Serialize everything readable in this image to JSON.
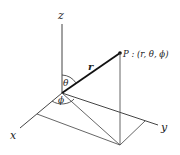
{
  "diagram": {
    "type": "spherical-coordinates",
    "labels": {
      "z_axis": "z",
      "x_axis": "x",
      "y_axis": "y",
      "radius": "r",
      "theta": "θ",
      "phi": "ϕ",
      "point": "P : (r, θ, ϕ)"
    },
    "colors": {
      "line": "#333333",
      "radius_line": "#111111",
      "background": "#ffffff"
    }
  }
}
